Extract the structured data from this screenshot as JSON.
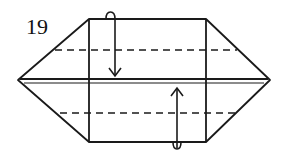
{
  "diagram": {
    "step_number": "19",
    "type": "origami fold diagram",
    "colors": {
      "line": "#1a1a1a",
      "background": "#ffffff"
    },
    "elements": {
      "outline": "hexagon with left and right pointed flaps",
      "valley_folds": [
        "upper dashed line",
        "lower dashed line"
      ],
      "arrows": [
        "fold top edge down behind",
        "fold bottom edge up behind"
      ]
    }
  }
}
